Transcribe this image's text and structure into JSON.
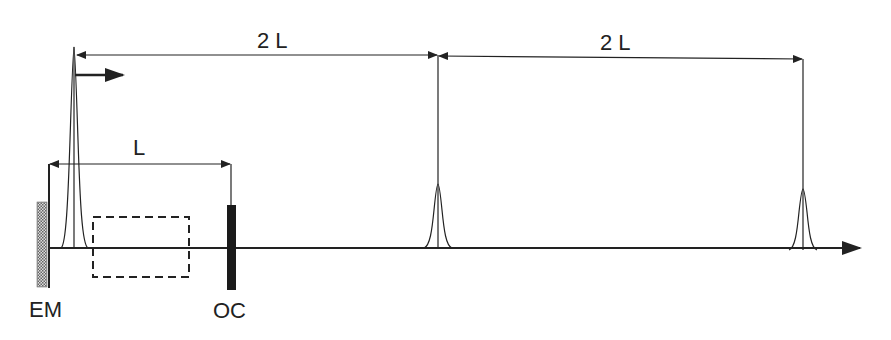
{
  "diagram": {
    "labels": {
      "em": "EM",
      "oc": "OC",
      "cavity_length": "L",
      "round_trip_1": "2 L",
      "round_trip_2": "2 L"
    },
    "colors": {
      "stroke": "#222222",
      "background": "#ffffff",
      "mirror_hatch": "#888888"
    }
  }
}
